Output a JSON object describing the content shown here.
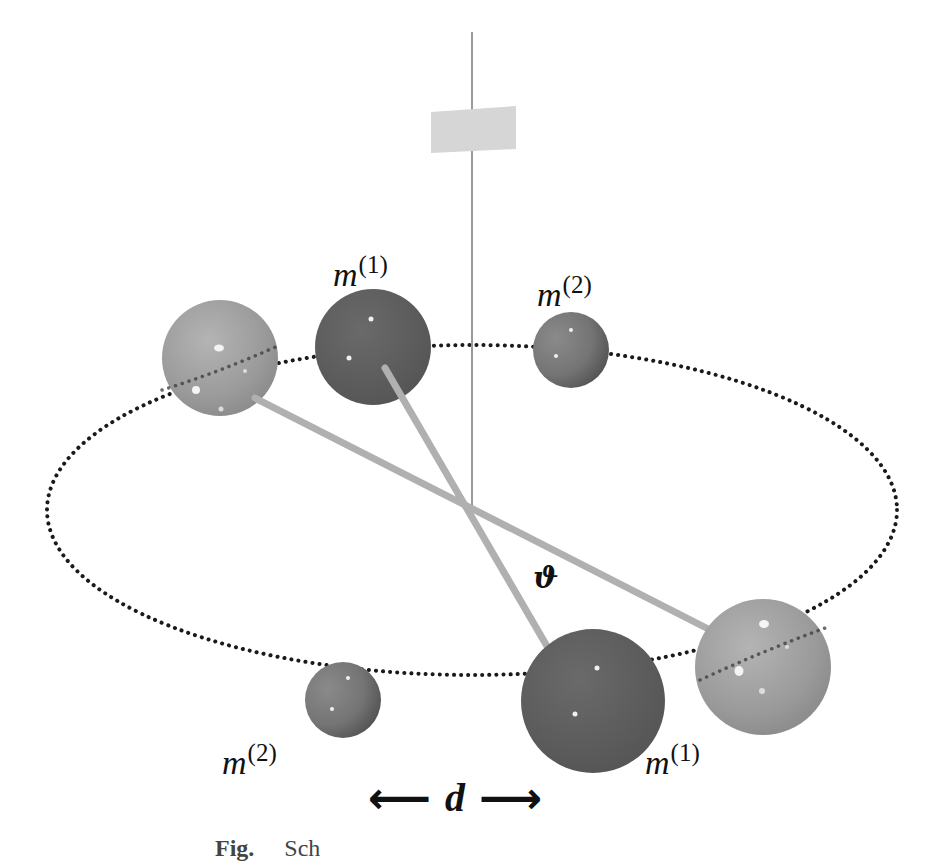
{
  "diagram": {
    "colors": {
      "background": "#ffffff",
      "fiber": "#9a9a9a",
      "mirror": "#d6d6d6",
      "orbit_dots": "#1a1a1a",
      "light_sphere": "#9c9c9c",
      "dark_sphere": "#5e5e5e",
      "small_sphere": "#7a7a7a",
      "bar": "#b0b0b0",
      "text": "#111111"
    },
    "labels": {
      "m1_top": {
        "base": "m",
        "sup": "(1)"
      },
      "m2_top": {
        "base": "m",
        "sup": "(2)"
      },
      "m2_bottom": {
        "base": "m",
        "sup": "(2)"
      },
      "m1_bottom": {
        "base": "m",
        "sup": "(1)"
      },
      "theta": "ϑ",
      "distance": "d",
      "arrow_left": "⟵",
      "arrow_right": "⟶"
    },
    "caption": {
      "prefix": "Fig.",
      "text": "Sch"
    }
  }
}
